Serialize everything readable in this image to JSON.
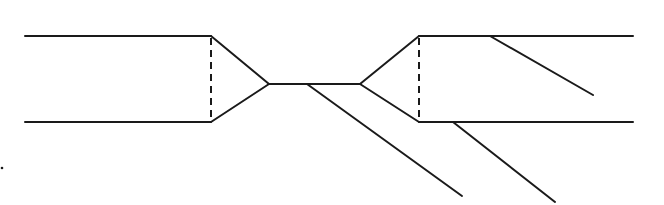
{
  "diagram": {
    "stroke_color": "#1a1a1a",
    "background": "#ffffff",
    "solid_lines": [
      {
        "id": "left-top-rail",
        "x1": 25,
        "y1": 36,
        "x2": 211,
        "y2": 36
      },
      {
        "id": "left-bottom-rail",
        "x1": 25,
        "y1": 122,
        "x2": 211,
        "y2": 122
      },
      {
        "id": "left-funnel-top",
        "x1": 211,
        "y1": 36,
        "x2": 269,
        "y2": 84
      },
      {
        "id": "left-funnel-bottom",
        "x1": 211,
        "y1": 122,
        "x2": 269,
        "y2": 84
      },
      {
        "id": "center-throat",
        "x1": 269,
        "y1": 84,
        "x2": 360,
        "y2": 84
      },
      {
        "id": "throat-diagonal",
        "x1": 307,
        "y1": 84,
        "x2": 462,
        "y2": 196
      },
      {
        "id": "right-funnel-top",
        "x1": 360,
        "y1": 84,
        "x2": 419,
        "y2": 36
      },
      {
        "id": "right-funnel-bottom",
        "x1": 360,
        "y1": 84,
        "x2": 419,
        "y2": 122
      },
      {
        "id": "right-top-rail",
        "x1": 419,
        "y1": 36,
        "x2": 633,
        "y2": 36
      },
      {
        "id": "right-bottom-rail",
        "x1": 419,
        "y1": 122,
        "x2": 633,
        "y2": 122
      },
      {
        "id": "top-rail-diagonal",
        "x1": 490,
        "y1": 36,
        "x2": 593,
        "y2": 95
      },
      {
        "id": "bottom-rail-diagonal",
        "x1": 453,
        "y1": 122,
        "x2": 555,
        "y2": 202
      }
    ],
    "dashed_lines": [
      {
        "id": "left-dashed-divider",
        "x1": 211,
        "y1": 38,
        "x2": 211,
        "y2": 120
      },
      {
        "id": "right-dashed-divider",
        "x1": 419,
        "y1": 38,
        "x2": 419,
        "y2": 120
      }
    ],
    "dots": [
      {
        "id": "stray-dot",
        "cx": 2,
        "cy": 168,
        "r": 1.3
      }
    ]
  }
}
